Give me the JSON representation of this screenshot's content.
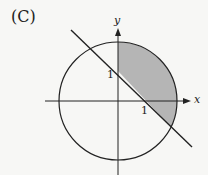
{
  "figure": {
    "panel_label": "(C)",
    "axes": {
      "x_label": "x",
      "y_label": "y"
    },
    "ticks": {
      "x_tick": "1",
      "y_tick": "1"
    },
    "colors": {
      "stroke": "#222222",
      "shade": "#b5b5b5",
      "background": "#f7f7f5"
    },
    "shapes": {
      "circle": {
        "center": [
          0,
          0
        ],
        "radius_units": 2
      },
      "line": {
        "equation": "y = -x + 1"
      },
      "shaded_region": "inside circle, right of y-axis, above line y = -x + 1"
    }
  }
}
